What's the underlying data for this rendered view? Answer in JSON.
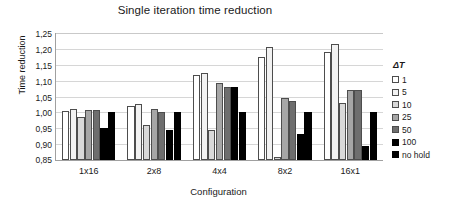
{
  "chart_data": {
    "type": "bar",
    "title": "Single iteration time reduction",
    "xlabel": "Configuration",
    "ylabel": "Time reduction",
    "categories": [
      "1x16",
      "2x8",
      "4x4",
      "8x2",
      "16x1"
    ],
    "ylim": [
      0.85,
      1.25
    ],
    "yticks": [
      "0,85",
      "0,90",
      "0,95",
      "1,00",
      "1,05",
      "1,10",
      "1,15",
      "1,20",
      "1,25"
    ],
    "ytick_values": [
      0.85,
      0.9,
      0.95,
      1.0,
      1.05,
      1.1,
      1.15,
      1.2,
      1.25
    ],
    "grid": true,
    "legend_position": "right",
    "legend_title": "ΔT",
    "series": [
      {
        "name": "1",
        "color": "#ffffff",
        "values": [
          1.005,
          1.021,
          1.118,
          1.176,
          1.19
        ]
      },
      {
        "name": "5",
        "color": "#f2f2f2",
        "values": [
          1.012,
          1.025,
          1.125,
          1.205,
          1.215
        ]
      },
      {
        "name": "10",
        "color": "#d9d9d9",
        "values": [
          0.984,
          0.96,
          0.946,
          0.861,
          1.03
        ]
      },
      {
        "name": "25",
        "color": "#a6a6a6",
        "values": [
          1.009,
          1.012,
          1.093,
          1.045,
          1.07
        ]
      },
      {
        "name": "50",
        "color": "#6e6e6e",
        "values": [
          1.007,
          1.002,
          1.081,
          1.035,
          1.072
        ]
      },
      {
        "name": "100",
        "color": "#000000",
        "values": [
          0.951,
          0.945,
          1.08,
          0.932,
          0.895
        ]
      },
      {
        "name": "no hold",
        "color": "#000000",
        "values": [
          1.0,
          1.0,
          1.0,
          1.0,
          1.0
        ]
      }
    ]
  }
}
